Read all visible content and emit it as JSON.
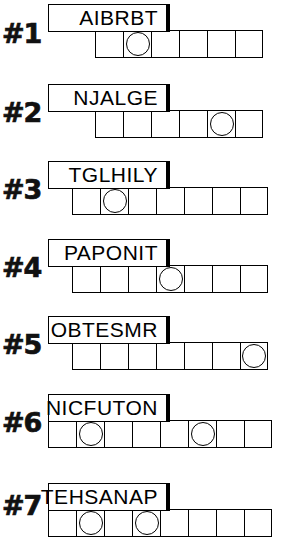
{
  "document": {
    "title": "Word Scramble Worksheet",
    "background_color": "#ffffff",
    "ink_color": "#000000",
    "rows_total": 7
  },
  "rows": [
    {
      "index_label": "#1",
      "word": "AIBRBT",
      "cell_count": 6,
      "circled_cells": [
        2
      ],
      "index_y": 20,
      "box": {
        "x": 48,
        "y": 4,
        "w": 122,
        "h": 28
      },
      "grid": {
        "x": 95,
        "y": 30,
        "cell": 28
      }
    },
    {
      "index_label": "#2",
      "word": "NJALGE",
      "cell_count": 6,
      "circled_cells": [
        5
      ],
      "index_y": 99,
      "box": {
        "x": 48,
        "y": 84,
        "w": 122,
        "h": 28
      },
      "grid": {
        "x": 95,
        "y": 110,
        "cell": 28
      }
    },
    {
      "index_label": "#3",
      "word": "TGLHILY",
      "cell_count": 7,
      "circled_cells": [
        2
      ],
      "index_y": 176,
      "box": {
        "x": 48,
        "y": 161,
        "w": 122,
        "h": 28
      },
      "grid": {
        "x": 72,
        "y": 187,
        "cell": 28
      }
    },
    {
      "index_label": "#4",
      "word": "PAPONIT",
      "cell_count": 7,
      "circled_cells": [
        4
      ],
      "index_y": 254,
      "box": {
        "x": 48,
        "y": 239,
        "w": 122,
        "h": 28
      },
      "grid": {
        "x": 72,
        "y": 265,
        "cell": 28
      }
    },
    {
      "index_label": "#5",
      "word": "OBTESMR",
      "cell_count": 7,
      "circled_cells": [
        7
      ],
      "index_y": 331,
      "box": {
        "x": 48,
        "y": 316,
        "w": 122,
        "h": 28
      },
      "grid": {
        "x": 72,
        "y": 342,
        "cell": 28
      }
    },
    {
      "index_label": "#6",
      "word": "NICFUTON",
      "cell_count": 8,
      "circled_cells": [
        2,
        6
      ],
      "index_y": 409,
      "box": {
        "x": 48,
        "y": 394,
        "w": 122,
        "h": 28
      },
      "grid": {
        "x": 48,
        "y": 420,
        "cell": 28
      }
    },
    {
      "index_label": "#7",
      "word": "TEHSANAP",
      "cell_count": 8,
      "circled_cells": [
        2,
        4
      ],
      "index_y": 492,
      "box": {
        "x": 48,
        "y": 483,
        "w": 122,
        "h": 28
      },
      "grid": {
        "x": 48,
        "y": 509,
        "cell": 28
      }
    }
  ]
}
